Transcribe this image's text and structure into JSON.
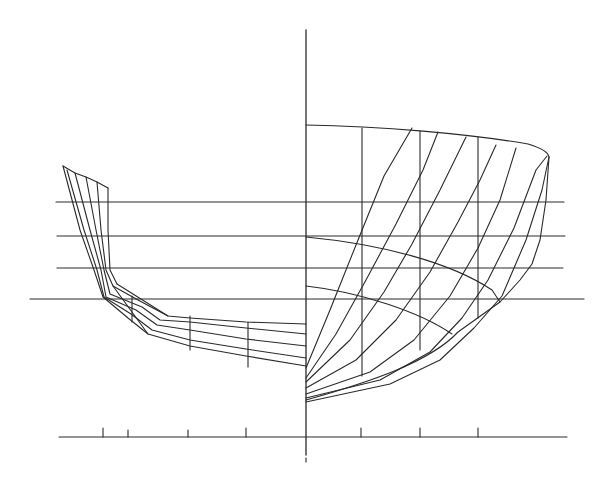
{
  "drawing": {
    "title": "",
    "type": "hull body plan",
    "stroke_color": "#2a2a2a",
    "background": "#ffffff",
    "width": 612,
    "height": 482
  },
  "centerline": {
    "x": 306,
    "y1": 30,
    "y2": 455,
    "lower_dash": [
      458,
      462
    ]
  },
  "waterlines": [
    {
      "y": 202,
      "x1": 56,
      "x2": 564
    },
    {
      "y": 236,
      "x1": 57,
      "x2": 565
    },
    {
      "y": 268,
      "x1": 57,
      "x2": 563
    },
    {
      "y": 299,
      "x1": 30,
      "x2": 584
    }
  ],
  "baseline": {
    "y": 437,
    "x1": 59,
    "x2": 567,
    "ticks": [
      {
        "x": 103,
        "len": 9
      },
      {
        "x": 128,
        "len": 7
      },
      {
        "x": 188,
        "len": 7
      },
      {
        "x": 246,
        "len": 9
      },
      {
        "x": 361,
        "len": 9
      },
      {
        "x": 420,
        "len": 9
      },
      {
        "x": 478,
        "len": 9
      }
    ],
    "center_tick": {
      "x": 306,
      "y1": 420,
      "y2": 450
    }
  },
  "aft_half": {
    "sheer": "63,166 75,173 86,177 97,182 108,188",
    "sections": [
      "63,166 80,230 94,270 103,297 128,318 148,334 190,346 246,356 306,366",
      "67,170 84,230 97,270 104,297 131,314 152,330 190,340 246,349 306,358",
      "75,173 90,230 101,270 106,297 136,310 157,325 190,330 246,339 306,346",
      "86,177 96,230 104,270 110,294 142,307 160,320 190,322 246,328 306,334",
      "97,182 101,230 106,270 113,286 138,300 168,316 190,318 246,322 306,324",
      "108,188 108,230 110,270 117,284"
    ],
    "section_ribs": [
      "117,284 168,316",
      "113,286 148,334"
    ],
    "verticals": [
      {
        "x": 132,
        "y1": 296,
        "y2": 322
      },
      {
        "x": 190,
        "y1": 316,
        "y2": 350
      },
      {
        "x": 248,
        "y1": 322,
        "y2": 367
      }
    ]
  },
  "fore_half": {
    "sheer": "M306,125 C380,126 470,134 528,144 Q548,150 549,157",
    "diagonals": [
      "306,368 330,310 358,240 384,176 412,128",
      "306,378 336,334 366,280 396,224 423,170 438,132",
      "306,382 350,340 384,292 412,244 440,190 466,137",
      "306,388 356,360 396,320 430,272 458,222 480,180 496,145",
      "306,394 370,372 414,340 450,296 478,248 500,200 516,148",
      "306,398 380,380 430,352 462,318 488,280 514,228 536,170 547,156",
      "306,402 390,384 440,360 474,328 502,296 526,240 542,190 549,157"
    ],
    "verticals": [
      {
        "x": 362,
        "y1": 128,
        "y2": 376
      },
      {
        "x": 420,
        "y1": 131,
        "y2": 350
      },
      {
        "x": 478,
        "y1": 137,
        "y2": 318
      }
    ],
    "arcs": [
      "M306,237 C380,244 450,262 492,290 L500,302",
      "M306,286 C360,292 420,312 452,334"
    ],
    "bottom": "M306,400 C370,382 430,362 458,332 L500,302 L520,280 L532,264 L540,240 L546,200 L549,157"
  }
}
